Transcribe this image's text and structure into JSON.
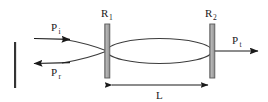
{
  "figure": {
    "name": "fabry-perot-cavity-diagram",
    "background_color": "#ffffff",
    "line_color": "#3c3c3c",
    "arrow_color": "#1a1a1a",
    "mirror_fill_color": "#a8a8a8",
    "mirror_stroke_color": "#5a5a5a",
    "text_color": "#1a1a1a"
  },
  "labels": {
    "incident_power": "P",
    "incident_power_sub": "i",
    "reflected_power": "P",
    "reflected_power_sub": "r",
    "transmitted_power": "P",
    "transmitted_power_sub": "t",
    "mirror_one": "R",
    "mirror_one_sub": "1",
    "mirror_two": "R",
    "mirror_two_sub": "2",
    "cavity_length": "L"
  },
  "geometry": {
    "mirror_one_x": 107,
    "mirror_two_x": 212,
    "mirror_top_y": 24,
    "mirror_bottom_y": 78,
    "mirror_width": 5,
    "cavity_center_y": 51,
    "dimension_line_y": 85,
    "left_marker_x": 15,
    "left_marker_top_y": 42,
    "left_marker_bottom_y": 88
  }
}
